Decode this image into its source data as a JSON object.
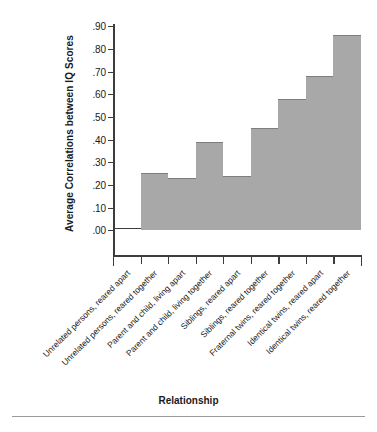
{
  "chart_data": {
    "type": "bar",
    "title": "",
    "xlabel": "Relationship",
    "ylabel": "Average Correlations between IQ Scores",
    "ylim": [
      0.0,
      0.9
    ],
    "grid": false,
    "legend": false,
    "y_tick_labels": [
      ".90",
      ".80",
      ".70",
      ".60",
      ".50",
      ".40",
      ".30",
      ".20",
      ".10",
      ".00"
    ],
    "y_tick_values": [
      0.9,
      0.8,
      0.7,
      0.6,
      0.5,
      0.4,
      0.3,
      0.2,
      0.1,
      0.0
    ],
    "categories": [
      "Unrelated persons, reared apart",
      "Unrelated persons, reared together",
      "Parent and child, living apart",
      "Parent and child, living together",
      "Siblings, reared apart",
      "Siblings, reared together",
      "Fraternal twins, reared together",
      "Identical twins, reared apart",
      "Identical twins, reared together"
    ],
    "values": [
      0.0,
      0.25,
      0.23,
      0.39,
      0.24,
      0.45,
      0.58,
      0.68,
      0.86
    ],
    "bar_color": "#a8a8a8",
    "bar_edge_color": "#7d7d7d",
    "axis_color": "#3c3c3c"
  },
  "axes": {
    "y_title": "Average Correlations between IQ Scores",
    "x_title": "Relationship"
  }
}
